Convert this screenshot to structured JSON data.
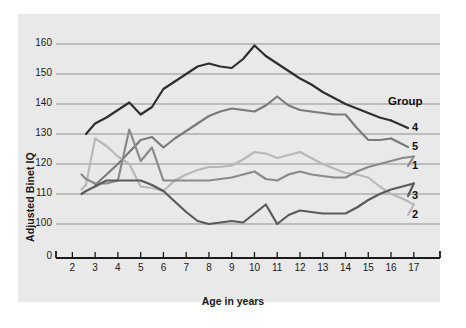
{
  "chart_data": {
    "type": "line",
    "title": "",
    "xlabel": "Age in years",
    "ylabel": "Adjusted Binet IQ",
    "xlim": [
      1.5,
      17.8
    ],
    "ylim": [
      95,
      164
    ],
    "grid": "horizontal",
    "legend_position": "right",
    "legend_title": "Group",
    "x_ticks": [
      2,
      3,
      4,
      5,
      6,
      7,
      8,
      9,
      10,
      11,
      12,
      13,
      14,
      15,
      16,
      17
    ],
    "y_ticks": [
      100,
      110,
      120,
      130,
      140,
      150,
      160
    ],
    "y_axis_origin_label": "0",
    "x": [
      2.4,
      2.6,
      3,
      3.5,
      4,
      4.5,
      5,
      5.5,
      6,
      6.5,
      7,
      7.5,
      8,
      8.5,
      9,
      9.5,
      10,
      10.5,
      11,
      11.5,
      12,
      12.5,
      13,
      13.5,
      14,
      14.5,
      15,
      15.5,
      16,
      16.5,
      17
    ],
    "series": [
      {
        "name": "4",
        "label": "4",
        "color": "#2e2e2e",
        "values": [
          null,
          130,
          133.5,
          135.5,
          138,
          140.5,
          136.5,
          139,
          145,
          147.5,
          150,
          152.5,
          153.5,
          152.5,
          152,
          155,
          159.5,
          156,
          153.5,
          151,
          148.5,
          146.5,
          144,
          142,
          140,
          138.5,
          137,
          135.5,
          134.5,
          null,
          null
        ]
      },
      {
        "name": "5",
        "label": "5",
        "color": "#7a7a7a",
        "values": [
          null,
          null,
          113,
          116.5,
          120,
          124,
          128,
          129,
          125.5,
          128.5,
          131,
          133.5,
          136,
          137.5,
          138.5,
          138,
          137.5,
          139.5,
          142.5,
          139.5,
          138,
          137.5,
          137,
          136.5,
          136.5,
          132,
          128,
          128,
          128.5,
          null,
          null
        ]
      },
      {
        "name": "2",
        "label": "2",
        "color": "#b8b8b8",
        "values": [
          111.5,
          113,
          128.5,
          126,
          122.5,
          120,
          112.5,
          112,
          111,
          114.5,
          116.5,
          118,
          119,
          119,
          119.5,
          121.5,
          124,
          123.5,
          122,
          123,
          124,
          122,
          120,
          118.5,
          117,
          116.5,
          115.5,
          112.5,
          110,
          108.5,
          106.5
        ]
      },
      {
        "name": "1",
        "label": "1",
        "color": "#8a8a8a",
        "values": [
          116.5,
          115,
          113.5,
          113.5,
          114.5,
          131.5,
          121,
          125.5,
          114.5,
          114.5,
          114.5,
          114.5,
          114.5,
          115,
          115.5,
          116.5,
          117.5,
          115,
          114.5,
          116.5,
          117.5,
          116.5,
          116,
          115.5,
          115.5,
          117.5,
          119,
          120,
          121,
          122,
          122.5
        ]
      },
      {
        "name": "3",
        "label": "3",
        "color": "#5a5a5a",
        "values": [
          110,
          111,
          112.5,
          114.5,
          114.5,
          114.5,
          114.5,
          113,
          111,
          107.5,
          104,
          101,
          100,
          100.5,
          101,
          100.5,
          103.5,
          106.5,
          100,
          103,
          104.5,
          104,
          103.5,
          103.5,
          103.5,
          105.5,
          108,
          110,
          111.5,
          112.5,
          113.5
        ]
      }
    ],
    "legend_labels": [
      "Group",
      "4",
      "5",
      "1",
      "3",
      "2"
    ]
  }
}
